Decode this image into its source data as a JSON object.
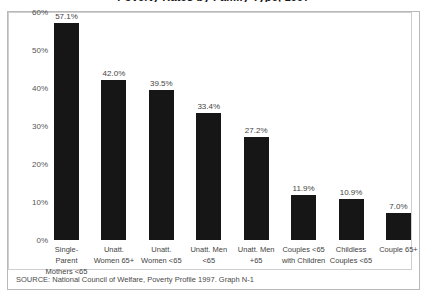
{
  "title": "Poverty Rates by Family Type, 1997",
  "source": "SOURCE:  National Council of Welfare, Poverty Profile 1997.  Graph N-1",
  "chart_data": {
    "type": "bar",
    "title": "Poverty Rates by Family Type, 1997",
    "xlabel": "",
    "ylabel": "",
    "ylim": [
      0,
      60
    ],
    "ytick_labels": [
      "60%",
      "50%",
      "40%",
      "30%",
      "20%",
      "10%",
      "0%"
    ],
    "ytick_values": [
      60,
      50,
      40,
      30,
      20,
      10,
      0
    ],
    "grid": false,
    "legend": false,
    "bar_color": "#161616",
    "categories": [
      "Single-Parent Mothers <65",
      "Unatt. Women 65+",
      "Unatt. Women <65",
      "Unatt. Men <65",
      "Unatt. Men +65",
      "Couples <65 with Children",
      "Childless Couples <65",
      "Couple 65+"
    ],
    "category_lines": [
      [
        "Single-Parent",
        "Mothers <65"
      ],
      [
        "Unatt.",
        "Women 65+"
      ],
      [
        "Unatt.",
        "Women <65"
      ],
      [
        "Unatt. Men",
        "<65"
      ],
      [
        "Unatt. Men",
        "+65"
      ],
      [
        "Couples <65",
        "with Children"
      ],
      [
        "Childless",
        "Couples <65"
      ],
      [
        "Couple 65+",
        ""
      ]
    ],
    "values": [
      57.1,
      42.0,
      39.5,
      33.4,
      27.2,
      11.9,
      10.9,
      7.0
    ],
    "value_labels": [
      "57.1%",
      "42.0%",
      "39.5%",
      "33.4%",
      "27.2%",
      "11.9%",
      "10.9%",
      "7.0%"
    ]
  }
}
